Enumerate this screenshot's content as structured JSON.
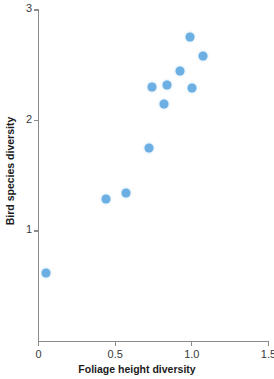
{
  "chart_data": {
    "type": "scatter",
    "title": "",
    "xlabel": "Foliage height diversity",
    "ylabel": "Bird species diversity",
    "xlim": [
      0,
      1.5
    ],
    "ylim": [
      0,
      3
    ],
    "xticks": [
      "0",
      "0.5",
      "1.0",
      "1.5"
    ],
    "xtick_values": [
      0,
      0.5,
      1.0,
      1.5
    ],
    "yticks": [
      "1",
      "2",
      "3"
    ],
    "ytick_values": [
      1,
      2,
      3
    ],
    "grid": false,
    "legend": false,
    "marker": {
      "shape": "circle",
      "color": "#6cafe3",
      "size_px": 9
    },
    "series": [
      {
        "name": "Bird species vs foliage height diversity",
        "points": [
          {
            "x": 0.05,
            "y": 0.62
          },
          {
            "x": 0.44,
            "y": 1.29
          },
          {
            "x": 0.57,
            "y": 1.34
          },
          {
            "x": 0.72,
            "y": 1.75
          },
          {
            "x": 0.74,
            "y": 2.3
          },
          {
            "x": 0.82,
            "y": 2.15
          },
          {
            "x": 0.84,
            "y": 2.32
          },
          {
            "x": 0.92,
            "y": 2.45
          },
          {
            "x": 0.99,
            "y": 2.76
          },
          {
            "x": 1.0,
            "y": 2.29
          },
          {
            "x": 1.07,
            "y": 2.58
          }
        ]
      }
    ]
  },
  "axes": {
    "x_title": "Foliage height diversity",
    "y_title": "Bird species diversity",
    "x_tick_labels": [
      "0",
      "0.5",
      "1.0",
      "1.5"
    ],
    "y_tick_labels": [
      "1",
      "2",
      "3"
    ]
  },
  "colors": {
    "marker": "#6cafe3",
    "axis": "#8b8b8b",
    "text": "#1c1c1c",
    "background": "#ffffff"
  }
}
